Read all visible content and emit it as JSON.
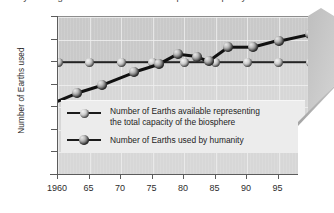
{
  "figure": {
    "title_clipped": "by which global demand exceeds the planet's capacity",
    "fold_icon": "page-fold-corner"
  },
  "chart_data": {
    "type": "line",
    "title": "",
    "xlabel": "",
    "ylabel": "Number of Earths used",
    "xlim": [
      1960,
      2000
    ],
    "ylim": [
      0.0,
      1.4
    ],
    "grid": true,
    "legend_position": "inside-lower-left",
    "x_tick_labels": [
      "1960",
      "65",
      "70",
      "75",
      "80",
      "85",
      "90",
      "95",
      "2000"
    ],
    "x_ticks": [
      1960,
      1965,
      1970,
      1975,
      1980,
      1985,
      1990,
      1995,
      2000
    ],
    "y_tick_labels": [
      "0.00",
      "0.20",
      "0.40",
      "0.60",
      "0.80",
      "1.00",
      "1.20",
      "1.40"
    ],
    "y_ticks": [
      0.0,
      0.2,
      0.4,
      0.6,
      0.8,
      1.0,
      1.2,
      1.4
    ],
    "series": [
      {
        "name": "Number of Earths available representing the total capacity of the biosphere",
        "marker": "sphere-light",
        "x": [
          1960,
          1965,
          1970,
          1975,
          1980,
          1985,
          1990,
          1995,
          2000
        ],
        "values": [
          1.0,
          1.0,
          1.0,
          1.0,
          1.0,
          1.0,
          1.0,
          1.0,
          1.0
        ]
      },
      {
        "name": "Number of Earths used by humanity",
        "marker": "sphere-dark",
        "x": [
          1960,
          1963,
          1967,
          1972,
          1976,
          1979,
          1982,
          1984,
          1987,
          1991,
          1995,
          2000
        ],
        "values": [
          0.66,
          0.73,
          0.8,
          0.91,
          0.98,
          1.07,
          1.05,
          1.01,
          1.13,
          1.13,
          1.19,
          1.25
        ]
      }
    ]
  },
  "legend": [
    {
      "line1": "Number of Earths available representing",
      "line2": "the total capacity of the biosphere"
    },
    {
      "line1": "Number of Earths used by humanity",
      "line2": ""
    }
  ]
}
